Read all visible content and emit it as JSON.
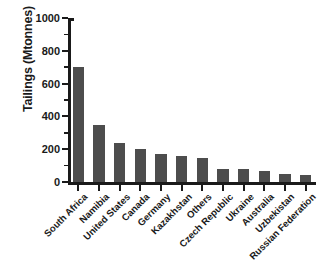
{
  "chart_data": {
    "type": "bar",
    "title": "",
    "xlabel": "",
    "ylabel": "Tailings (Mtonnes)",
    "ylim": [
      0,
      1000
    ],
    "ytick_major": [
      0,
      200,
      400,
      600,
      800,
      1000
    ],
    "ytick_minor": [
      100,
      300,
      500,
      700,
      900
    ],
    "grid": false,
    "legend": false,
    "bar_color": "#4d4d4d",
    "axis_color": "#1a1a1a",
    "background": "#ffffff",
    "categories": [
      "South Africa",
      "Namibia",
      "United States",
      "Canada",
      "Germany",
      "Kazakhstan",
      "Others",
      "Czech Republic",
      "Ukraine",
      "Australia",
      "Uzbekistan",
      "Russian Federation"
    ],
    "values": [
      700,
      350,
      235,
      200,
      170,
      160,
      145,
      80,
      78,
      70,
      50,
      45
    ]
  }
}
